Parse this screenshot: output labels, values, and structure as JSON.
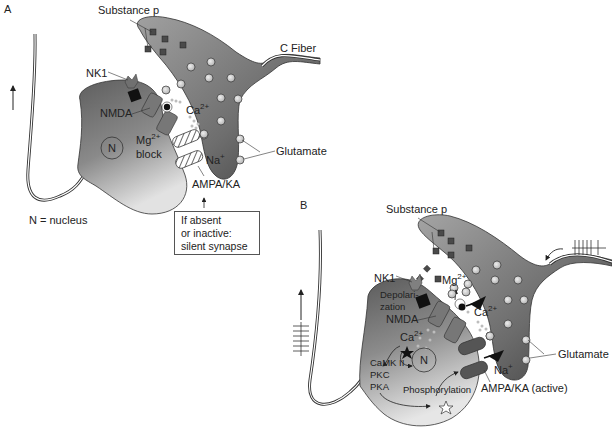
{
  "panels": {
    "a": {
      "label": "A",
      "substance_p": "Substance p",
      "c_fiber": "C Fiber",
      "nk1": "NK1",
      "nmda": "NMDA",
      "ca": "Ca",
      "ca_sup": "2+",
      "mg": "Mg",
      "mg_sup": "2+",
      "block": "block",
      "nucleus": "N",
      "na": "Na",
      "na_sup": "+",
      "glutamate": "Glutamate",
      "ampa": "AMPA/KA",
      "legend": "N = nucleus",
      "note_lines": [
        "If absent",
        "or inactive:",
        "silent synapse"
      ]
    },
    "b": {
      "label": "B",
      "substance_p": "Substance p",
      "nk1": "NK1",
      "mg": "Mg",
      "mg_sup": "2+",
      "depol_1": "Depolari-",
      "depol_2": "zation",
      "nmda": "NMDA",
      "ca_outer": "Ca",
      "ca_outer_sup": "2+",
      "ca_inner": "Ca",
      "ca_inner_sup": "2+",
      "nucleus": "N",
      "kinase_1": "CaMK II",
      "kinase_2": "PKC",
      "kinase_3": "PKA",
      "phosphorylation": "Phosphorylation",
      "na": "Na",
      "na_sup": "+",
      "glutamate": "Glutamate",
      "ampa": "AMPA/KA (active)"
    }
  },
  "colors": {
    "neuron_dark": "#5a5a5a",
    "neuron_light": "#d8d8d8",
    "fiber_dark": "#4a4a4a",
    "fiber_light": "#9a9a9a",
    "receptor": "#6e6e6e",
    "receptor_b": "#505050",
    "vesicle": "#cfcfcf",
    "substance_p": "#444444",
    "outline": "#333333"
  }
}
